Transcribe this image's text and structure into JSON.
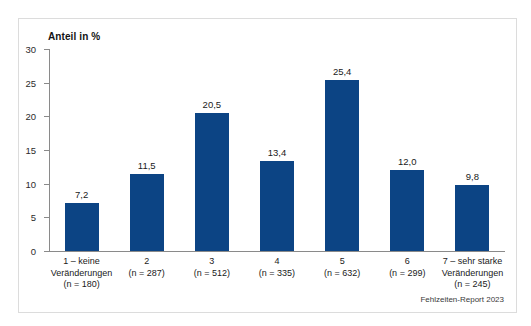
{
  "figure": {
    "axis_title": "Anteil in %",
    "source_note": "Fehlzeiten-Report 2023",
    "bar_color": "#0c4484",
    "axis_color": "#8a8a8a",
    "frame_color": "#dcdcdc",
    "background": "#ffffff"
  },
  "chart_data": {
    "type": "bar",
    "title": "",
    "subtitle": "",
    "xlabel": "",
    "ylabel": "Anteil in %",
    "ylim": [
      0,
      30
    ],
    "yticks": [
      0,
      5,
      10,
      15,
      20,
      25,
      30
    ],
    "ytick_labels": [
      "0",
      "5",
      "10",
      "15",
      "20",
      "25",
      "30"
    ],
    "grid": false,
    "legend": null,
    "annotation": "Fehlzeiten-Report 2023",
    "categories": [
      "1 – keine Veränderungen (n = 180)",
      "2 (n = 287)",
      "3 (n = 512)",
      "4 (n = 335)",
      "5 (n = 632)",
      "6 (n = 299)",
      "7 – sehr starke Veränderungen (n = 245)"
    ],
    "category_lines": [
      [
        "1 – keine",
        "Veränderungen",
        "(n = 180)"
      ],
      [
        "2",
        "(n = 287)"
      ],
      [
        "3",
        "(n = 512)"
      ],
      [
        "4",
        "(n = 335)"
      ],
      [
        "5",
        "(n = 632)"
      ],
      [
        "6",
        "(n = 299)"
      ],
      [
        "7 – sehr starke",
        "Veränderungen",
        "(n = 245)"
      ]
    ],
    "values": [
      7.2,
      11.5,
      20.5,
      13.4,
      25.4,
      12.0,
      9.8
    ],
    "value_labels": [
      "7,2",
      "11,5",
      "20,5",
      "13,4",
      "25,4",
      "12,0",
      "9,8"
    ],
    "sample_sizes": [
      180,
      287,
      512,
      335,
      632,
      299,
      245
    ]
  }
}
